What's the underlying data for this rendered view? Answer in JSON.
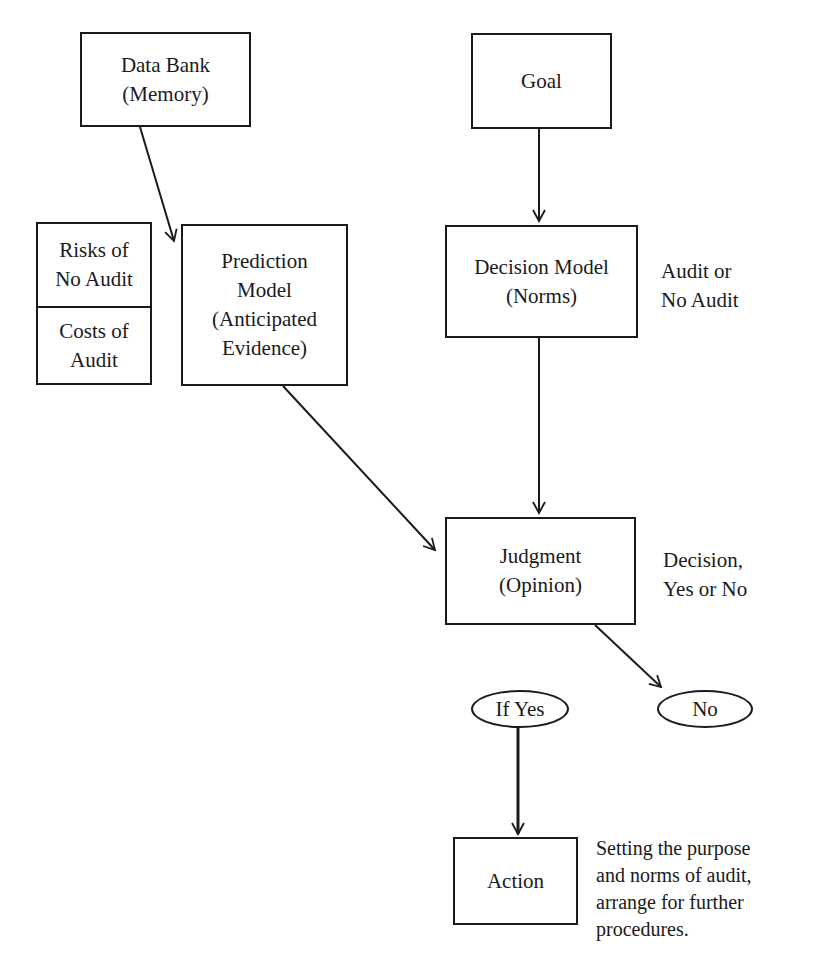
{
  "diagram": {
    "nodes": {
      "data_bank": {
        "lines": [
          "Data Bank",
          "(Memory)"
        ]
      },
      "goal": {
        "lines": [
          "Goal"
        ]
      },
      "risks_costs": {
        "top": [
          "Risks of",
          "No Audit"
        ],
        "bottom": [
          "Costs of",
          "Audit"
        ]
      },
      "prediction_model": {
        "lines": [
          "Prediction",
          "Model",
          "(Anticipated",
          "Evidence)"
        ]
      },
      "decision_model": {
        "lines": [
          "Decision Model",
          "(Norms)"
        ]
      },
      "judgment": {
        "lines": [
          "Judgment",
          "(Opinion)"
        ]
      },
      "if_yes": {
        "label": "If Yes"
      },
      "no": {
        "label": "No"
      },
      "action": {
        "lines": [
          "Action"
        ]
      }
    },
    "annotations": {
      "decision_model_note": [
        "Audit or",
        "No Audit"
      ],
      "judgment_note": [
        "Decision,",
        "Yes or No"
      ],
      "action_note": [
        "Setting the purpose",
        "and norms of audit,",
        "arrange for further",
        "procedures."
      ]
    },
    "edges": [
      {
        "from": "data_bank",
        "to": "prediction_model"
      },
      {
        "from": "goal",
        "to": "decision_model"
      },
      {
        "from": "decision_model",
        "to": "judgment"
      },
      {
        "from": "prediction_model",
        "to": "judgment"
      },
      {
        "from": "judgment",
        "to": "no"
      },
      {
        "from": "if_yes",
        "to": "action"
      }
    ],
    "colors": {
      "stroke": "#1a1a1a",
      "background": "#ffffff"
    }
  }
}
